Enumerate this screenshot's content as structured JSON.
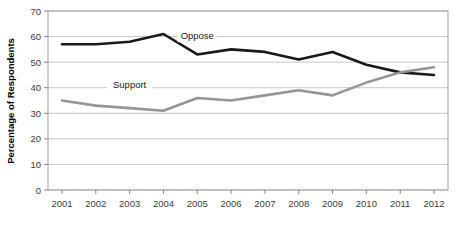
{
  "chart_data": {
    "type": "line",
    "title": "",
    "xlabel": "",
    "ylabel": "Percentage of Respondents",
    "categories": [
      "2001",
      "2002",
      "2003",
      "2004",
      "2005",
      "2006",
      "2007",
      "2008",
      "2009",
      "2010",
      "2011",
      "2012"
    ],
    "ylim": [
      0,
      70
    ],
    "yticks": [
      "0",
      "10",
      "20",
      "30",
      "40",
      "50",
      "60",
      "70"
    ],
    "ytick_values": [
      0,
      10,
      20,
      30,
      40,
      50,
      60,
      70
    ],
    "grid": true,
    "legend_position": "inline-annotation",
    "series": [
      {
        "name": "Oppose",
        "color": "#1a1a1a",
        "values": [
          57,
          57,
          58,
          61,
          53,
          55,
          54,
          51,
          54,
          49,
          46,
          45
        ],
        "label_x": "2005",
        "label_value": 59
      },
      {
        "name": "Support",
        "color": "#969696",
        "values": [
          35,
          33,
          32,
          31,
          36,
          35,
          37,
          39,
          37,
          42,
          46,
          48
        ],
        "label_x": "2003",
        "label_value": 40
      }
    ]
  },
  "axis": {
    "y_title": "Percentage of Respondents"
  }
}
